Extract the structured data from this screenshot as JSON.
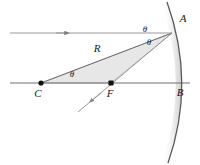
{
  "figure": {
    "type": "optics-ray-diagram",
    "background_color": "#ffffff",
    "line_color": "#6e6e6e",
    "label_color": "#1a1a1a",
    "triangle_fill": "#e6e6e6",
    "triangle_stroke": "#9a9a9a",
    "mirror_stroke": "#5a5a5a",
    "mirror_shadow": "#d8d8d8"
  },
  "labels": {
    "vertex_A": "A",
    "vertex_B": "B",
    "center_C": "C",
    "focus_F": "F",
    "radius_R": "R",
    "theta_incident": "θ",
    "theta_reflected": "θ",
    "theta_center": "θ"
  },
  "points": {
    "A": {
      "x": 172,
      "y": 33
    },
    "B": {
      "x": 182,
      "y": 83
    },
    "C": {
      "x": 41,
      "y": 83
    },
    "F": {
      "x": 111,
      "y": 83
    }
  },
  "label_positions": {
    "A": {
      "x": 183,
      "y": 22
    },
    "B": {
      "x": 180,
      "y": 95
    },
    "C": {
      "x": 37,
      "y": 97
    },
    "F": {
      "x": 109,
      "y": 97
    },
    "R": {
      "x": 97,
      "y": 51
    },
    "theta_incident": {
      "x": 144,
      "y": 33
    },
    "theta_reflected": {
      "x": 148,
      "y": 45
    },
    "theta_center": {
      "x": 71,
      "y": 77
    }
  },
  "rays": {
    "incident": {
      "name": "incoming-parallel-ray",
      "from": {
        "x": 10,
        "y": 33
      },
      "to": {
        "x": 172,
        "y": 33
      },
      "arrow_at": {
        "x": 64,
        "y": 33
      },
      "direction": "right"
    },
    "reflected": {
      "name": "reflected-ray-through-focus",
      "from": {
        "x": 172,
        "y": 33
      },
      "to": {
        "x": 78,
        "y": 112
      },
      "arrow_at": {
        "x": 90,
        "y": 102
      },
      "direction": "down-left"
    },
    "axis": {
      "name": "principal-axis",
      "from": {
        "x": 10,
        "y": 83
      },
      "to": {
        "x": 190,
        "y": 83
      }
    },
    "radius": {
      "name": "radius-line-C-to-A",
      "from": {
        "x": 41,
        "y": 83
      },
      "to": {
        "x": 172,
        "y": 33
      }
    }
  },
  "mirror": {
    "name": "concave-mirror-arc",
    "path": "M 167,2 Q 196,83 168,163",
    "vertex_x": 182
  },
  "triangle": {
    "name": "shaded-triangle-C-A-F",
    "vertices": [
      {
        "x": 41,
        "y": 83
      },
      {
        "x": 172,
        "y": 33
      },
      {
        "x": 111,
        "y": 83
      }
    ]
  }
}
